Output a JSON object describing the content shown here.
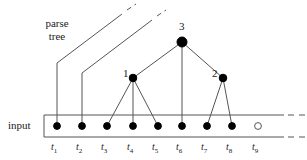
{
  "figure": {
    "colors": {
      "stroke": "#555555",
      "node_fill": "#000000",
      "node_open_fill": "#ffffff",
      "text": "#222222",
      "background": "#ffffff"
    }
  },
  "labels": {
    "parse_tree_line1": "parse",
    "parse_tree_line2": "tree",
    "input": "input"
  },
  "tree": {
    "nodes": [
      {
        "id": "root",
        "label": "3",
        "x": 182,
        "y": 42,
        "filled": true,
        "label_x": 179,
        "label_y": 21
      },
      {
        "id": "n1",
        "label": "1",
        "x": 133,
        "y": 78,
        "filled": true,
        "label_x": 123,
        "label_y": 68
      },
      {
        "id": "n2",
        "label": "2",
        "x": 223,
        "y": 78,
        "filled": true,
        "label_x": 212,
        "label_y": 68
      }
    ],
    "edges": [
      {
        "from": "root",
        "to": "n1"
      },
      {
        "from": "root",
        "to": "t6"
      },
      {
        "from": "root",
        "to": "n2"
      },
      {
        "from": "n1",
        "to": "t3"
      },
      {
        "from": "n1",
        "to": "t4"
      },
      {
        "from": "n1",
        "to": "t5"
      },
      {
        "from": "n2",
        "to": "t7"
      },
      {
        "from": "n2",
        "to": "t8"
      }
    ],
    "dangling": [
      {
        "from": "t1",
        "bend_x": 57,
        "bend_y": 63,
        "end_x": 122,
        "end_y": 14,
        "dash_x": 136,
        "dash_y": 4
      },
      {
        "from": "t2",
        "bend_x": 82,
        "bend_y": 73,
        "end_x": 152,
        "end_y": 20,
        "dash_x": 166,
        "dash_y": 10
      }
    ]
  },
  "input_strip": {
    "box": {
      "x": 44,
      "y": 115,
      "width": 240,
      "height": 22
    },
    "dashed_continuation": true,
    "tokens": [
      {
        "label": "t",
        "sub": "1",
        "x": 57,
        "filled": true
      },
      {
        "label": "t",
        "sub": "2",
        "x": 82,
        "filled": true
      },
      {
        "label": "t",
        "sub": "3",
        "x": 107,
        "filled": true
      },
      {
        "label": "t",
        "sub": "4",
        "x": 133,
        "filled": true
      },
      {
        "label": "t",
        "sub": "5",
        "x": 158,
        "filled": true
      },
      {
        "label": "t",
        "sub": "6",
        "x": 182,
        "filled": true
      },
      {
        "label": "t",
        "sub": "7",
        "x": 207,
        "filled": true
      },
      {
        "label": "t",
        "sub": "8",
        "x": 232,
        "filled": true
      },
      {
        "label": "t",
        "sub": "9",
        "x": 258,
        "filled": false
      }
    ],
    "dot_y": 126,
    "tick_label_y": 142
  }
}
